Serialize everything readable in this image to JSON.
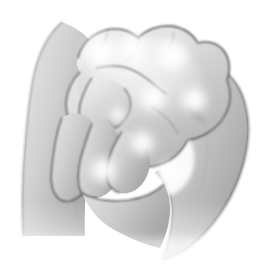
{
  "image": {
    "title": "Hand massage pressure points illustration",
    "alt_text": "Grayscale line drawing of two hands: a clenched fist being gripped and massaged by the fingers of the other hand, with glowing white spots marking pressure points",
    "style": "grayscale pencil-shaded line art",
    "background_color": "#ffffff"
  },
  "palette": {
    "background": "#ffffff",
    "skin_light": "#f2f2f2",
    "skin_mid": "#c9c9c9",
    "skin_midtone": "#bdbdbd",
    "skin_shadow": "#9a9a9a",
    "skin_deep_shadow": "#8a8a8a",
    "outline": "#3a3a3a",
    "outline_soft": "#5a5a5a",
    "highlight": "#ffffff",
    "glow": "#ffffff"
  },
  "parts": [
    {
      "id": "left-forearm",
      "label": "Left forearm and wrist",
      "description": "Large shaded column entering from the upper left and running down to the lower left corner, softly faded at the bottom edge"
    },
    {
      "id": "fist",
      "label": "Clenched fist",
      "description": "Top-center mass with four knuckle bumps along the upper contour"
    },
    {
      "id": "knuckles",
      "label": "Knuckle ridge",
      "description": "Row of rounded bumps across the top of the fist"
    },
    {
      "id": "thumb-upper",
      "label": "Thumb of gripping hand",
      "description": "Wedge shape crossing the middle of the fist from the left"
    },
    {
      "id": "fingers-lower-left",
      "label": "Curled fingers of gripping hand",
      "description": "Three overlapping finger forms in the lower-left quadrant pressing into the fist"
    },
    {
      "id": "right-hand-wrap",
      "label": "Wrapping hand and wrist",
      "description": "Broad crescent sweeping down the right side and curving left toward the bottom center"
    },
    {
      "id": "inner-hollow",
      "label": "Inner hollow",
      "description": "White negative space between the fist and the wrapping hand on the right"
    }
  ],
  "highlights": [
    {
      "id": "hl-1",
      "label": "pressure-point-knuckle-left",
      "cx": 100,
      "cy": 52,
      "r": 20
    },
    {
      "id": "hl-2",
      "label": "pressure-point-knuckle-mid",
      "cx": 133,
      "cy": 48,
      "r": 17
    },
    {
      "id": "hl-3",
      "label": "pressure-point-knuckle-right",
      "cx": 172,
      "cy": 55,
      "r": 19
    },
    {
      "id": "hl-4",
      "label": "pressure-point-back-of-hand",
      "cx": 153,
      "cy": 98,
      "r": 16
    },
    {
      "id": "hl-5",
      "label": "pressure-point-upper-right",
      "cx": 194,
      "cy": 100,
      "r": 16
    },
    {
      "id": "hl-6",
      "label": "pressure-point-center",
      "cx": 142,
      "cy": 143,
      "r": 15
    },
    {
      "id": "hl-7",
      "label": "pressure-point-finger",
      "cx": 103,
      "cy": 170,
      "r": 16
    },
    {
      "id": "hl-8",
      "label": "pressure-point-lower-right",
      "cx": 168,
      "cy": 172,
      "r": 12
    },
    {
      "id": "hl-9",
      "label": "pressure-point-thumb-web",
      "cx": 118,
      "cy": 115,
      "r": 10
    }
  ],
  "shading_bands": [
    {
      "id": "band-forearm",
      "label": "Left forearm shading",
      "from": "#d6d6d6",
      "to": "#a6a6a6"
    },
    {
      "id": "band-fist",
      "label": "Fist body shading",
      "from": "#efefef",
      "to": "#b4b4b4"
    },
    {
      "id": "band-wrap",
      "label": "Wrapping hand shading",
      "from": "#d2d2d2",
      "to": "#9f9f9f"
    },
    {
      "id": "band-fingers",
      "label": "Finger shading",
      "from": "#e4e4e4",
      "to": "#b0b0b0"
    }
  ]
}
